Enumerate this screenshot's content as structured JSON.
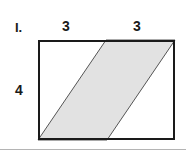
{
  "figure": {
    "problem_number": "I.",
    "labels": {
      "top_left_segment": "3",
      "top_right_segment": "3",
      "left_side": "4"
    },
    "colors": {
      "shaded_fill": "#e2e2e2",
      "outline": "#1a1a1a",
      "slant_line": "#555555",
      "background": "#ffffff",
      "divider": "#b4b4b4"
    },
    "geometry": {
      "rectangle": {
        "x": 38,
        "y": 40,
        "width": 137,
        "height": 100,
        "stroke_width": 2
      },
      "parallelogram_points": "38,140 106,40 175,40 107,140",
      "slant_stroke_width": 1
    }
  },
  "chart_data": {
    "type": "diagram",
    "title": "I.",
    "shape": "rectangle with inscribed shaded parallelogram",
    "labeled_dimensions": [
      {
        "name": "top-left segment",
        "value": 3,
        "position": "top"
      },
      {
        "name": "top-right segment",
        "value": 3,
        "position": "top"
      },
      {
        "name": "height",
        "value": 4,
        "position": "left"
      }
    ],
    "rectangle_dimensions": {
      "width": 6,
      "height": 4
    },
    "parallelogram_base": 3,
    "parallelogram_height": 4
  }
}
